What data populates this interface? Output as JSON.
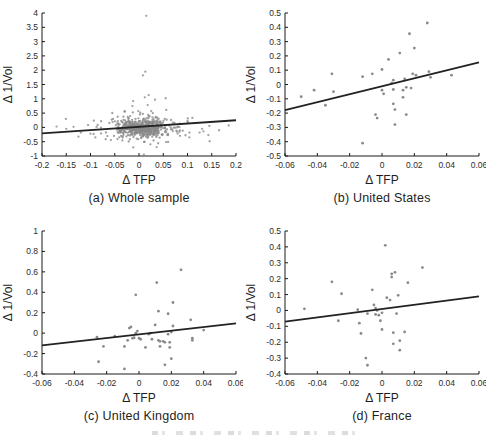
{
  "colors": {
    "background": "#ffffff",
    "axis": "#1a1a1a",
    "tick_text": "#2b2b2b",
    "label_text": "#1e1e1e",
    "marker": "#8a8a8a",
    "trend_line": "#222222"
  },
  "chart_data": [
    {
      "id": "a",
      "type": "scatter",
      "caption": "(a) Whole sample",
      "xlabel": "Δ TFP",
      "ylabel": "Δ 1/Vol",
      "xlim": [
        -0.2,
        0.2
      ],
      "ylim": [
        -1,
        4
      ],
      "xticks": [
        -0.2,
        -0.15,
        -0.1,
        -0.05,
        0,
        0.05,
        0.1,
        0.15,
        0.2
      ],
      "yticks": [
        -1,
        -0.5,
        0,
        0.5,
        1,
        1.5,
        2,
        2.5,
        3,
        3.5,
        4
      ],
      "trend": {
        "x": [
          -0.2,
          0.2
        ],
        "y": [
          -0.21,
          0.25
        ]
      },
      "marker_radius": 1.15,
      "marker_opacity": 0.8,
      "points": [
        [
          0.015,
          3.9
        ],
        [
          0.013,
          1.95
        ],
        [
          0.008,
          1.82
        ],
        [
          0.02,
          1.13
        ],
        [
          0.012,
          1.05
        ],
        [
          0.033,
          0.97
        ],
        [
          0.055,
          1.02
        ],
        [
          -0.012,
          0.92
        ],
        [
          0.018,
          0.78
        ],
        [
          -0.17,
          0.03
        ],
        [
          -0.15,
          -0.05
        ],
        [
          -0.135,
          0.02
        ],
        [
          -0.12,
          -0.18
        ],
        [
          -0.105,
          0.08
        ],
        [
          -0.1,
          -0.22
        ],
        [
          -0.09,
          -0.35
        ],
        [
          0.11,
          0.33
        ],
        [
          0.125,
          -0.18
        ],
        [
          0.13,
          -0.05
        ],
        [
          0.145,
          0.05
        ],
        [
          0.165,
          -0.1
        ],
        [
          0.185,
          0.07
        ],
        [
          0.1,
          0.22
        ],
        [
          0.01,
          -0.95
        ]
      ],
      "cloud": {
        "seed": 7,
        "clusters": [
          [
            520,
            0.008,
            0.024,
            0.0,
            0.16
          ],
          [
            90,
            0.004,
            0.045,
            -0.02,
            0.27
          ],
          [
            20,
            0.0,
            0.085,
            0.0,
            0.33
          ]
        ],
        "clip_x": [
          -0.195,
          0.195
        ],
        "clip_y": [
          -0.88,
          1.2
        ]
      }
    },
    {
      "id": "b",
      "type": "scatter",
      "caption": "(b) United States",
      "xlabel": "Δ TFP",
      "ylabel": "Δ 1/Vol",
      "xlim": [
        -0.06,
        0.06
      ],
      "ylim": [
        -0.5,
        0.5
      ],
      "xticks": [
        -0.06,
        -0.04,
        -0.02,
        0,
        0.02,
        0.04,
        0.06
      ],
      "yticks": [
        -0.5,
        -0.4,
        -0.3,
        -0.2,
        -0.1,
        0,
        0.1,
        0.2,
        0.3,
        0.4,
        0.5
      ],
      "trend": {
        "x": [
          -0.06,
          0.06
        ],
        "y": [
          -0.18,
          0.155
        ]
      },
      "marker_radius": 1.4,
      "marker_opacity": 1,
      "points": [
        [
          -0.05,
          -0.085
        ],
        [
          -0.042,
          -0.04
        ],
        [
          -0.035,
          -0.145
        ],
        [
          -0.031,
          0.075
        ],
        [
          -0.03,
          -0.05
        ],
        [
          -0.012,
          0.055
        ],
        [
          -0.012,
          -0.41
        ],
        [
          -0.006,
          0.075
        ],
        [
          -0.004,
          -0.21
        ],
        [
          -0.003,
          -0.235
        ],
        [
          0.0,
          0.105
        ],
        [
          0.0,
          -0.04
        ],
        [
          0.001,
          -0.065
        ],
        [
          0.004,
          0.175
        ],
        [
          0.006,
          0.01
        ],
        [
          0.007,
          0.03
        ],
        [
          0.007,
          -0.035
        ],
        [
          0.007,
          -0.135
        ],
        [
          0.008,
          -0.175
        ],
        [
          0.008,
          -0.28
        ],
        [
          0.011,
          0.22
        ],
        [
          0.013,
          -0.04
        ],
        [
          0.013,
          -0.09
        ],
        [
          0.014,
          0.04
        ],
        [
          0.015,
          -0.02
        ],
        [
          0.015,
          -0.21
        ],
        [
          0.017,
          0.355
        ],
        [
          0.018,
          -0.025
        ],
        [
          0.019,
          0.075
        ],
        [
          0.02,
          0.255
        ],
        [
          0.021,
          0.065
        ],
        [
          0.028,
          0.43
        ],
        [
          0.029,
          0.09
        ],
        [
          0.03,
          0.05
        ],
        [
          0.043,
          0.065
        ]
      ]
    },
    {
      "id": "c",
      "type": "scatter",
      "caption": "(c) United Kingdom",
      "xlabel": "Δ TFP",
      "ylabel": "Δ 1/Vol",
      "xlim": [
        -0.06,
        0.06
      ],
      "ylim": [
        -0.4,
        1
      ],
      "xticks": [
        -0.06,
        -0.04,
        -0.02,
        0,
        0.02,
        0.04,
        0.06
      ],
      "yticks": [
        -0.4,
        -0.2,
        0,
        0.2,
        0.4,
        0.6,
        0.8,
        1
      ],
      "trend": {
        "x": [
          -0.06,
          0.06
        ],
        "y": [
          -0.12,
          0.095
        ]
      },
      "marker_radius": 1.4,
      "marker_opacity": 1,
      "points": [
        [
          -0.026,
          -0.04
        ],
        [
          -0.025,
          -0.28
        ],
        [
          -0.022,
          -0.13
        ],
        [
          -0.015,
          -0.03
        ],
        [
          -0.009,
          -0.13
        ],
        [
          -0.009,
          -0.35
        ],
        [
          -0.007,
          -0.07
        ],
        [
          -0.006,
          0.05
        ],
        [
          -0.005,
          0.06
        ],
        [
          -0.004,
          -0.05
        ],
        [
          -0.003,
          -0.045
        ],
        [
          -0.002,
          0.375
        ],
        [
          -0.002,
          0.0
        ],
        [
          -0.001,
          0.02
        ],
        [
          0.0,
          -0.05
        ],
        [
          0.001,
          -0.06
        ],
        [
          0.004,
          -0.14
        ],
        [
          0.006,
          -0.01
        ],
        [
          0.007,
          0.0
        ],
        [
          0.008,
          -0.06
        ],
        [
          0.01,
          0.08
        ],
        [
          0.011,
          0.495
        ],
        [
          0.012,
          0.215
        ],
        [
          0.012,
          -0.07
        ],
        [
          0.013,
          -0.08
        ],
        [
          0.013,
          -0.13
        ],
        [
          0.015,
          -0.08
        ],
        [
          0.016,
          -0.09
        ],
        [
          0.016,
          -0.31
        ],
        [
          0.018,
          0.19
        ],
        [
          0.018,
          -0.01
        ],
        [
          0.019,
          -0.09
        ],
        [
          0.019,
          -0.14
        ],
        [
          0.02,
          -0.25
        ],
        [
          0.02,
          0.01
        ],
        [
          0.021,
          0.3
        ],
        [
          0.021,
          0.07
        ],
        [
          0.026,
          0.62
        ],
        [
          0.032,
          0.13
        ],
        [
          0.033,
          -0.05
        ],
        [
          0.033,
          -0.07
        ],
        [
          0.04,
          0.03
        ]
      ]
    },
    {
      "id": "d",
      "type": "scatter",
      "caption": "(d) France",
      "xlabel": "Δ TFP",
      "ylabel": "Δ 1/Vol",
      "xlim": [
        -0.06,
        0.06
      ],
      "ylim": [
        -0.4,
        0.5
      ],
      "xticks": [
        -0.06,
        -0.04,
        -0.02,
        0,
        0.02,
        0.04,
        0.06
      ],
      "yticks": [
        -0.4,
        -0.3,
        -0.2,
        -0.1,
        0,
        0.1,
        0.2,
        0.3,
        0.4,
        0.5
      ],
      "trend": {
        "x": [
          -0.06,
          0.06
        ],
        "y": [
          -0.07,
          0.088
        ]
      },
      "marker_radius": 1.4,
      "marker_opacity": 1,
      "points": [
        [
          -0.048,
          0.01
        ],
        [
          -0.031,
          0.18
        ],
        [
          -0.027,
          -0.065
        ],
        [
          -0.025,
          0.105
        ],
        [
          -0.015,
          0.005
        ],
        [
          -0.014,
          -0.08
        ],
        [
          -0.013,
          -0.145
        ],
        [
          -0.01,
          -0.3
        ],
        [
          -0.009,
          -0.02
        ],
        [
          -0.009,
          -0.345
        ],
        [
          -0.006,
          0.13
        ],
        [
          -0.005,
          0.035
        ],
        [
          -0.004,
          0.015
        ],
        [
          -0.004,
          -0.025
        ],
        [
          -0.003,
          0.0
        ],
        [
          -0.002,
          -0.03
        ],
        [
          -0.001,
          -0.065
        ],
        [
          0.0,
          -0.015
        ],
        [
          0.0,
          -0.12
        ],
        [
          0.002,
          0.41
        ],
        [
          0.003,
          0.08
        ],
        [
          0.005,
          0.065
        ],
        [
          0.006,
          0.23
        ],
        [
          0.006,
          0.21
        ],
        [
          0.007,
          -0.14
        ],
        [
          0.007,
          -0.21
        ],
        [
          0.008,
          0.24
        ],
        [
          0.009,
          -0.02
        ],
        [
          0.01,
          0.095
        ],
        [
          0.011,
          -0.19
        ],
        [
          0.011,
          -0.25
        ],
        [
          0.014,
          -0.135
        ],
        [
          0.016,
          0.175
        ],
        [
          0.025,
          0.27
        ]
      ]
    }
  ]
}
